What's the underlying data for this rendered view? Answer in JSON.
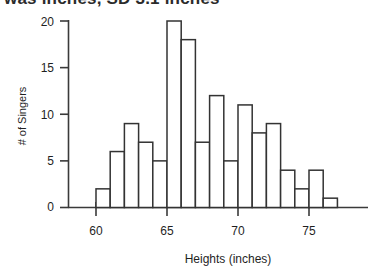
{
  "title": {
    "text": "was inches, SD 3.1 inches"
  },
  "chart_data": {
    "type": "bar",
    "title": "",
    "subtitle": "",
    "xlabel": "Heights (inches)",
    "ylabel": "# of Singers",
    "bin_width": 1,
    "grid": false,
    "legend": false,
    "xlim": [
      57.5,
      78
    ],
    "ylim": [
      0,
      21
    ],
    "xticks": [
      60,
      65,
      70,
      75
    ],
    "xtick_labels": [
      "60",
      "65",
      "70",
      "75"
    ],
    "xminor_tick_step": 1,
    "yticks": [
      0,
      5,
      10,
      15,
      20
    ],
    "ytick_labels": [
      "0",
      "5",
      "10",
      "15",
      "20"
    ],
    "categories": [
      "60-61",
      "61-62",
      "62-63",
      "63-64",
      "64-65",
      "65-66",
      "66-67",
      "67-68",
      "68-69",
      "69-70",
      "70-71",
      "71-72",
      "72-73",
      "73-74",
      "74-75",
      "75-76",
      "76-77"
    ],
    "bin_edges": [
      60,
      61,
      62,
      63,
      64,
      65,
      66,
      67,
      68,
      69,
      70,
      71,
      72,
      73,
      74,
      75,
      76,
      77
    ],
    "values": [
      2,
      6,
      9,
      7,
      5,
      20,
      18,
      7,
      12,
      5,
      11,
      8,
      9,
      4,
      2,
      4,
      1
    ],
    "bar_fill_color": "#ffffff",
    "bar_edge_color": "#333333",
    "axis_color": "#3a3a3a"
  }
}
